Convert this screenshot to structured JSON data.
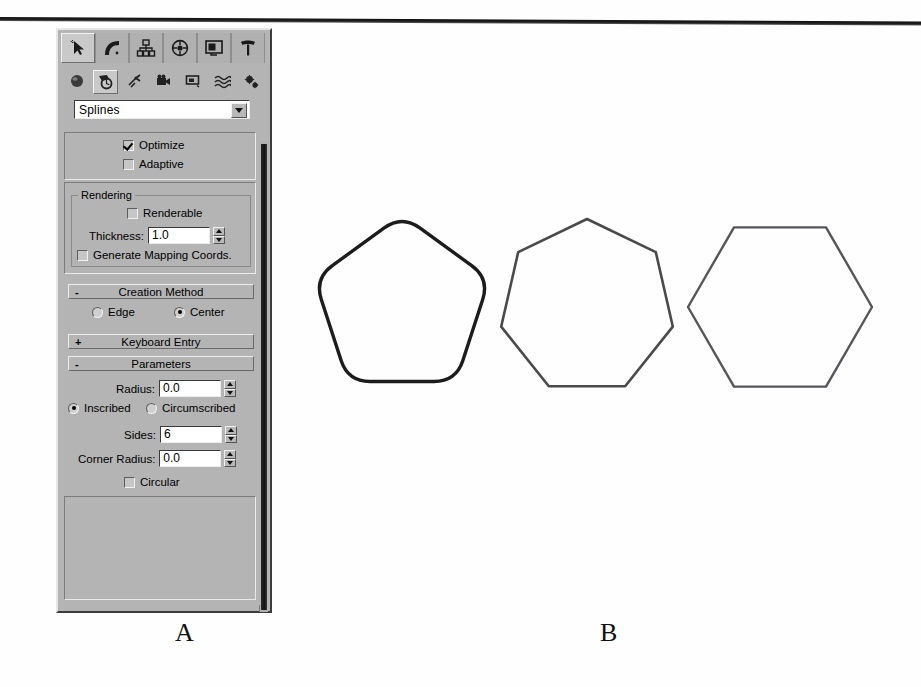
{
  "figure": {
    "captions": [
      {
        "label": "A",
        "x": 175,
        "y": 618
      },
      {
        "label": "B",
        "x": 600,
        "y": 618
      }
    ]
  },
  "panel": {
    "tabs": [
      {
        "name": "create-tab",
        "icon": "arrow-pointer-icon",
        "active": true
      },
      {
        "name": "modify-tab",
        "icon": "bent-tube-icon",
        "active": false
      },
      {
        "name": "hierarchy-tab",
        "icon": "hierarchy-tree-icon",
        "active": false
      },
      {
        "name": "motion-tab",
        "icon": "wheel-icon",
        "active": false
      },
      {
        "name": "display-tab",
        "icon": "monitor-icon",
        "active": false
      },
      {
        "name": "utilities-tab",
        "icon": "hammer-icon",
        "active": false
      }
    ],
    "object_types": [
      {
        "name": "geometry-button",
        "icon": "sphere-icon",
        "selected": false
      },
      {
        "name": "shapes-button",
        "icon": "shapes-icon",
        "selected": true
      },
      {
        "name": "lights-button",
        "icon": "light-icon",
        "selected": false
      },
      {
        "name": "cameras-button",
        "icon": "camera-icon",
        "selected": false
      },
      {
        "name": "helpers-button",
        "icon": "helper-icon",
        "selected": false
      },
      {
        "name": "space-warps-button",
        "icon": "waves-icon",
        "selected": false
      },
      {
        "name": "systems-button",
        "icon": "gears-icon",
        "selected": false
      }
    ],
    "category_combo": {
      "value": "Splines",
      "options": [
        "Splines",
        "NURBS Curves",
        "Extended Splines"
      ]
    },
    "interpolation": {
      "optimize": {
        "label": "Optimize",
        "checked": true
      },
      "adaptive": {
        "label": "Adaptive",
        "checked": false
      }
    },
    "rendering": {
      "group_label": "Rendering",
      "renderable": {
        "label": "Renderable",
        "checked": false
      },
      "thickness": {
        "label": "Thickness:",
        "value": "1.0"
      },
      "mapping_coords": {
        "label": "Generate Mapping Coords.",
        "checked": false
      }
    },
    "creation_method": {
      "header": "Creation Method",
      "sign": "-",
      "edge": {
        "label": "Edge",
        "selected": false
      },
      "center": {
        "label": "Center",
        "selected": true
      }
    },
    "keyboard_entry": {
      "header": "Keyboard Entry",
      "sign": "+"
    },
    "parameters": {
      "header": "Parameters",
      "sign": "-",
      "radius": {
        "label": "Radius:",
        "value": "0.0"
      },
      "inscribed": {
        "label": "Inscribed",
        "selected": true
      },
      "circumscribed": {
        "label": "Circumscribed",
        "selected": false
      },
      "sides": {
        "label": "Sides:",
        "value": "6"
      },
      "corner_radius": {
        "label": "Corner Radius:",
        "value": "0.0"
      },
      "circular": {
        "label": "Circular",
        "checked": false
      }
    }
  },
  "shapes": [
    {
      "name": "rounded-pentagon-shape",
      "sides": 5,
      "corner_radius": 22,
      "stroke": "#1c1c1c",
      "stroke_width": 3.4,
      "cx": 112,
      "cy": 107,
      "r": 92,
      "rotation": -90
    },
    {
      "name": "heptagon-shape",
      "sides": 7,
      "corner_radius": 0,
      "stroke": "#4a4a4a",
      "stroke_width": 2.6,
      "cx": 297,
      "cy": 107,
      "r": 88,
      "rotation": -90
    },
    {
      "name": "hexagon-shape",
      "sides": 6,
      "corner_radius": 0,
      "stroke": "#55565a",
      "stroke_width": 2.4,
      "cx": 490,
      "cy": 107,
      "r": 92,
      "rotation": 0
    }
  ]
}
